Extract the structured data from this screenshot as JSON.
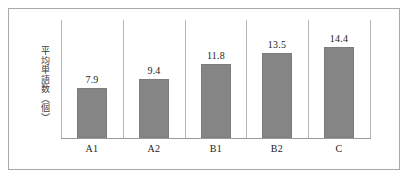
{
  "chart_data": {
    "type": "bar",
    "title": "",
    "subtitle": "",
    "xlabel": "",
    "ylabel": "平均単語数（個）",
    "categories": [
      "A1",
      "A2",
      "B1",
      "B2",
      "C"
    ],
    "values": [
      7.9,
      9.4,
      11.8,
      13.5,
      14.4
    ],
    "value_labels": [
      "7.9",
      "9.4",
      "11.8",
      "13.5",
      "14.4"
    ],
    "series": [
      {
        "name": "平均単語数",
        "values": [
          7.9,
          9.4,
          11.8,
          13.5,
          14.4
        ]
      }
    ],
    "ylim": [
      0,
      18.7
    ],
    "grid": false,
    "y_ticks_visible": false,
    "legend": null,
    "legend_position": "none",
    "annotations": [],
    "colors": {
      "bar_fill": "#858585",
      "bar_border": "#7c7c7c",
      "axis_line": "#9a9a9a",
      "divider": "#b5b5b5",
      "frame_border": "#a9a9a9",
      "text": "#1c1c1c",
      "background": "#ffffff"
    }
  },
  "axis": {
    "y_label_text": "平均単語数（個）"
  },
  "figure": {
    "background": "#ffffff"
  }
}
